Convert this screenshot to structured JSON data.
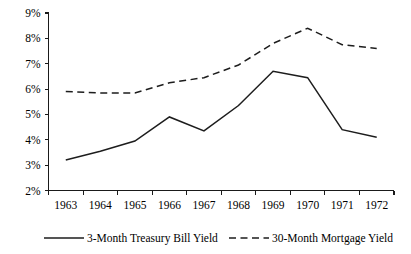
{
  "chart_data": {
    "type": "line",
    "title": "",
    "subtitle": "",
    "xlabel": "",
    "ylabel": "",
    "x": [
      "1963",
      "1964",
      "1965",
      "1966",
      "1967",
      "1968",
      "1969",
      "1970",
      "1971",
      "1972"
    ],
    "categories": [
      "1963",
      "1964",
      "1965",
      "1966",
      "1967",
      "1968",
      "1969",
      "1970",
      "1971",
      "1972"
    ],
    "ylim": [
      2,
      9
    ],
    "yticks": [
      2,
      3,
      4,
      5,
      6,
      7,
      8,
      9
    ],
    "ytick_labels": [
      "2%",
      "3%",
      "4%",
      "5%",
      "6%",
      "7%",
      "8%",
      "9%"
    ],
    "xtick_labels": [
      "1963",
      "1964",
      "1965",
      "1966",
      "1967",
      "1968",
      "1969",
      "1970",
      "1971",
      "1972"
    ],
    "grid": false,
    "legend_position": "bottom",
    "series": [
      {
        "name": "3-Month Treasury Bill Yield",
        "style": "solid",
        "color": "#1d1d1d",
        "values": [
          3.2,
          3.55,
          3.95,
          4.9,
          4.35,
          5.35,
          6.7,
          6.45,
          4.4,
          4.1
        ]
      },
      {
        "name": "30-Month Mortgage Yield",
        "style": "dashed",
        "color": "#1d1d1d",
        "values": [
          5.9,
          5.85,
          5.85,
          6.25,
          6.45,
          6.95,
          7.8,
          8.4,
          7.75,
          7.6
        ]
      }
    ]
  },
  "legend": {
    "entries": [
      {
        "label": "3-Month Treasury Bill Yield",
        "style": "solid"
      },
      {
        "label": "30-Month Mortgage Yield",
        "style": "dashed"
      }
    ]
  },
  "axes": {
    "y_labels": [
      "9%",
      "8%",
      "7%",
      "6%",
      "5%",
      "4%",
      "3%",
      "2%"
    ],
    "x_labels": [
      "1963",
      "1964",
      "1965",
      "1966",
      "1967",
      "1968",
      "1969",
      "1970",
      "1971",
      "1972"
    ]
  },
  "colors": {
    "line": "#1d1d1d",
    "axis": "#1a1a1a",
    "background": "#ffffff"
  }
}
